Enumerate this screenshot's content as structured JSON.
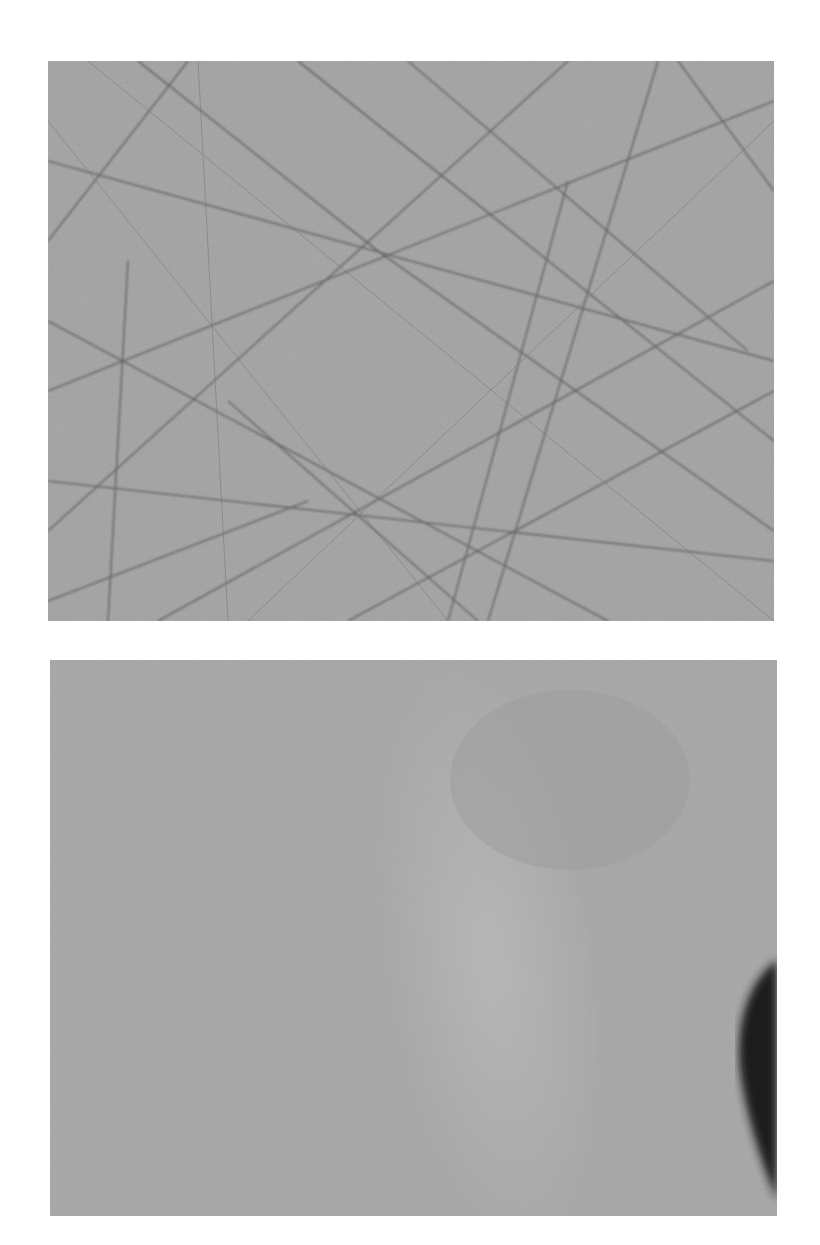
{
  "figure": {
    "panels": [
      {
        "id": "top",
        "description": "grayscale micrograph of a scratched surface with many intersecting straight lines",
        "base_color": "#a2a2a2",
        "line_color": "#5c5c5c"
      },
      {
        "id": "bottom",
        "description": "grayscale micrograph of a smoother surface with a lighter diagonal band and a dark blob at the right edge",
        "base_color": "#a6a6a6",
        "highlight_color": "#bdbdbd",
        "blob_color": "#1e1e1e"
      }
    ]
  }
}
